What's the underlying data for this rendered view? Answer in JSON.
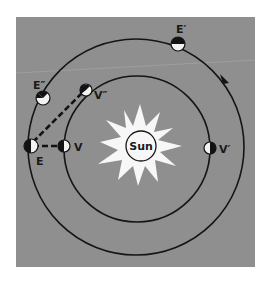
{
  "diagram": {
    "colors": {
      "page_background": "#ffffff",
      "panel_background": "#8f8f8f",
      "orbit_line": "#151515",
      "sun_fill": "#f7f7f7",
      "planet_dark": "#121212",
      "planet_light": "#f2f2f2",
      "sight_line": "#121212"
    },
    "sun": {
      "label": "Sun"
    },
    "orbits": [
      {
        "name": "earth-orbit",
        "body": "Earth"
      },
      {
        "name": "venus-orbit",
        "body": "Venus"
      }
    ],
    "direction_arrow": {
      "orbit": "earth-orbit",
      "direction": "counterclockwise"
    },
    "positions": [
      {
        "id": "E",
        "label": "E",
        "body": "Earth"
      },
      {
        "id": "E1",
        "label": "E′",
        "body": "Earth"
      },
      {
        "id": "E2",
        "label": "E″",
        "body": "Earth"
      },
      {
        "id": "V",
        "label": "V",
        "body": "Venus"
      },
      {
        "id": "V1",
        "label": "V′",
        "body": "Venus"
      },
      {
        "id": "V2",
        "label": "V″",
        "body": "Venus"
      }
    ],
    "sight_lines": [
      {
        "from": "E",
        "to": "V",
        "style": "dashed"
      },
      {
        "from": "E",
        "to": "V2",
        "style": "dashed"
      }
    ]
  }
}
